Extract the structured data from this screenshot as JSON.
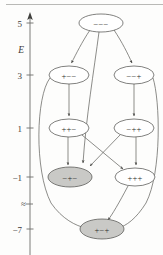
{
  "figure": {
    "type": "energy-level-transition-diagram",
    "axis": {
      "name": "E",
      "orientation": "vertical",
      "arrow_at_top": true,
      "has_break": true,
      "break_symbol": "≈",
      "break_y_value": -3,
      "ticks": [
        {
          "label": "5",
          "value": 5,
          "y": 23
        },
        {
          "label": "3",
          "value": 3,
          "y": 75
        },
        {
          "label": "1",
          "value": 1,
          "y": 128
        },
        {
          "label": "−1",
          "value": -1,
          "y": 177
        },
        {
          "label": "−7",
          "value": -7,
          "y": 229
        }
      ],
      "axis_title": "E",
      "axis_title_y": 50
    },
    "nodes": [
      {
        "id": "n0",
        "label": "−−−",
        "energy": 5,
        "cx": 101,
        "cy": 23,
        "rx": 22,
        "ry": 9,
        "shaded": false
      },
      {
        "id": "n1",
        "label": "+−−",
        "energy": 3,
        "cx": 69,
        "cy": 75,
        "rx": 20,
        "ry": 9,
        "shaded": false
      },
      {
        "id": "n2",
        "label": "−−+",
        "energy": 3,
        "cx": 134,
        "cy": 75,
        "rx": 20,
        "ry": 9,
        "shaded": false
      },
      {
        "id": "n3",
        "label": "++−",
        "energy": 1,
        "cx": 69,
        "cy": 128,
        "rx": 20,
        "ry": 9,
        "shaded": false
      },
      {
        "id": "n4",
        "label": "−++",
        "energy": 1,
        "cx": 134,
        "cy": 128,
        "rx": 20,
        "ry": 9,
        "shaded": false
      },
      {
        "id": "n5",
        "label": "−+−",
        "energy": -1,
        "cx": 70,
        "cy": 177,
        "rx": 22,
        "ry": 10,
        "shaded": true
      },
      {
        "id": "n6",
        "label": "+++",
        "energy": -1,
        "cx": 135,
        "cy": 177,
        "rx": 20,
        "ry": 9,
        "shaded": false
      },
      {
        "id": "n7",
        "label": "+−+",
        "energy": -7,
        "cx": 102,
        "cy": 229,
        "rx": 22,
        "ry": 10,
        "shaded": true
      }
    ],
    "edges": [
      {
        "from": "n0",
        "to": "n1",
        "kind": "straight"
      },
      {
        "from": "n0",
        "to": "n2",
        "kind": "straight"
      },
      {
        "from": "n0",
        "to": "n5",
        "kind": "long-curve-center"
      },
      {
        "from": "n1",
        "to": "n3",
        "kind": "straight"
      },
      {
        "from": "n1",
        "to": "n7",
        "kind": "long-curve-left"
      },
      {
        "from": "n2",
        "to": "n4",
        "kind": "straight"
      },
      {
        "from": "n2",
        "to": "n7",
        "kind": "long-curve-right"
      },
      {
        "from": "n3",
        "to": "n5",
        "kind": "straight"
      },
      {
        "from": "n3",
        "to": "n6",
        "kind": "crossing"
      },
      {
        "from": "n4",
        "to": "n5",
        "kind": "crossing"
      },
      {
        "from": "n4",
        "to": "n6",
        "kind": "straight"
      },
      {
        "from": "n6",
        "to": "n7",
        "kind": "straight"
      }
    ]
  }
}
